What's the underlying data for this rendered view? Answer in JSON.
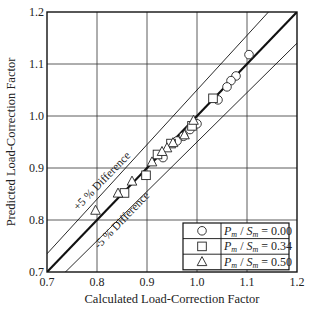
{
  "chart_data": {
    "type": "scatter",
    "title": "",
    "xlabel": "Calculated Load-Correction Factor",
    "ylabel": "Predicted Load-Correction Factor",
    "xlim": [
      0.7,
      1.2
    ],
    "ylim": [
      0.7,
      1.2
    ],
    "x_ticks": [
      "0.7",
      "0.8",
      "0.9",
      "1.0",
      "1.1",
      "1.2"
    ],
    "y_ticks": [
      "0.7",
      "0.8",
      "0.9",
      "1.0",
      "1.1",
      "1.2"
    ],
    "grid": true,
    "legend_position": "lower right",
    "reference_lines": [
      {
        "name": "1:1 line",
        "slope": 1.0,
        "offset_pct": 0,
        "style": "thick"
      },
      {
        "name": "+5 % Difference",
        "slope": 1.05,
        "offset_pct": 5,
        "style": "thin"
      },
      {
        "name": "-5 % Difference",
        "slope": 0.95,
        "offset_pct": -5,
        "style": "thin"
      }
    ],
    "annotations": [
      {
        "text": "+5 % Difference",
        "x": 0.815,
        "y": 0.87,
        "rotation": -46
      },
      {
        "text": "-5 % Difference",
        "x": 0.855,
        "y": 0.795,
        "rotation": -46
      }
    ],
    "series": [
      {
        "name": "Pm / Sm = 0.00",
        "marker": "circle",
        "points": [
          [
            1.104,
            1.118
          ],
          [
            1.078,
            1.077
          ],
          [
            1.068,
            1.068
          ],
          [
            1.06,
            1.056
          ],
          [
            1.042,
            1.031
          ],
          [
            1.0,
            0.985
          ],
          [
            0.986,
            0.974
          ],
          [
            0.973,
            0.961
          ],
          [
            0.96,
            0.952
          ],
          [
            0.932,
            0.92
          ]
        ]
      },
      {
        "name": "Pm / Sm = 0.34",
        "marker": "square",
        "points": [
          [
            1.032,
            1.034
          ],
          [
            0.99,
            0.981
          ],
          [
            0.948,
            0.947
          ],
          [
            0.921,
            0.926
          ],
          [
            0.898,
            0.886
          ],
          [
            0.855,
            0.852
          ]
        ]
      },
      {
        "name": "Pm / Sm = 0.50",
        "marker": "triangle",
        "points": [
          [
            0.993,
            0.991
          ],
          [
            0.975,
            0.963
          ],
          [
            0.952,
            0.948
          ],
          [
            0.94,
            0.938
          ],
          [
            0.93,
            0.931
          ],
          [
            0.91,
            0.911
          ],
          [
            0.87,
            0.874
          ],
          [
            0.842,
            0.851
          ],
          [
            0.797,
            0.818
          ]
        ]
      }
    ]
  },
  "legend": {
    "rows": [
      {
        "marker": "circle",
        "p": "P",
        "p_sub": "m",
        "s": "S",
        "s_sub": "m",
        "value": " = 0.00"
      },
      {
        "marker": "square",
        "p": "P",
        "p_sub": "m",
        "s": "S",
        "s_sub": "m",
        "value": " = 0.34"
      },
      {
        "marker": "triangle",
        "p": "P",
        "p_sub": "m",
        "s": "S",
        "s_sub": "m",
        "value": " = 0.50"
      }
    ]
  },
  "colors": {
    "axis": "#111111",
    "grid": "#333333",
    "marker_stroke": "#222222",
    "marker_fill": "#ffffff"
  }
}
